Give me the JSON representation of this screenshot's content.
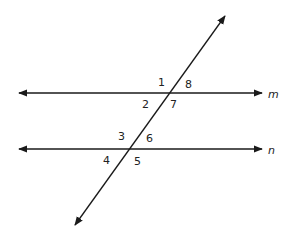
{
  "diagram": {
    "line_color": "#1a1a1a",
    "lines": {
      "m": {
        "label": "m",
        "y": 93,
        "x1": 19,
        "x2": 262
      },
      "n": {
        "label": "n",
        "y": 149,
        "x1": 19,
        "x2": 262
      },
      "transversal": {
        "x1": 75,
        "y1": 225,
        "x2": 225,
        "y2": 16
      }
    },
    "angles": [
      {
        "id": "1",
        "label": "1"
      },
      {
        "id": "2",
        "label": "2"
      },
      {
        "id": "3",
        "label": "3"
      },
      {
        "id": "4",
        "label": "4"
      },
      {
        "id": "5",
        "label": "5"
      },
      {
        "id": "6",
        "label": "6"
      },
      {
        "id": "7",
        "label": "7"
      },
      {
        "id": "8",
        "label": "8"
      }
    ]
  }
}
